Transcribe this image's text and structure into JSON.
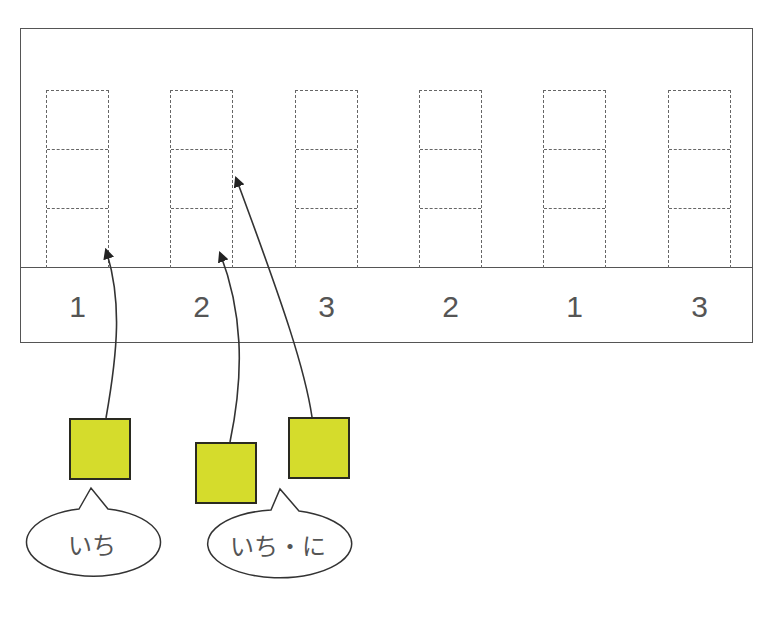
{
  "diagram": {
    "columns": [
      {
        "label": "1",
        "x": 46,
        "cells": 3
      },
      {
        "label": "2",
        "x": 170,
        "cells": 3
      },
      {
        "label": "3",
        "x": 295,
        "cells": 3
      },
      {
        "label": "2",
        "x": 419,
        "cells": 3
      },
      {
        "label": "1",
        "x": 543,
        "cells": 3
      },
      {
        "label": "3",
        "x": 668,
        "cells": 3
      }
    ],
    "blocks": [
      {
        "name": "block-1",
        "x": 69,
        "y": 418,
        "target_column": 0,
        "target_cell": "bottom"
      },
      {
        "name": "block-2",
        "x": 195,
        "y": 442,
        "target_column": 1,
        "target_cell": "bottom"
      },
      {
        "name": "block-3",
        "x": 288,
        "y": 417,
        "target_column": 1,
        "target_cell": "middle"
      }
    ],
    "bubbles": [
      {
        "text": "いち"
      },
      {
        "text": "いち・に"
      }
    ],
    "colors": {
      "block_fill": "#d5dc2c",
      "block_border": "#2a2a20",
      "line": "#555555",
      "dashed": "#666666",
      "text": "#555555"
    }
  }
}
